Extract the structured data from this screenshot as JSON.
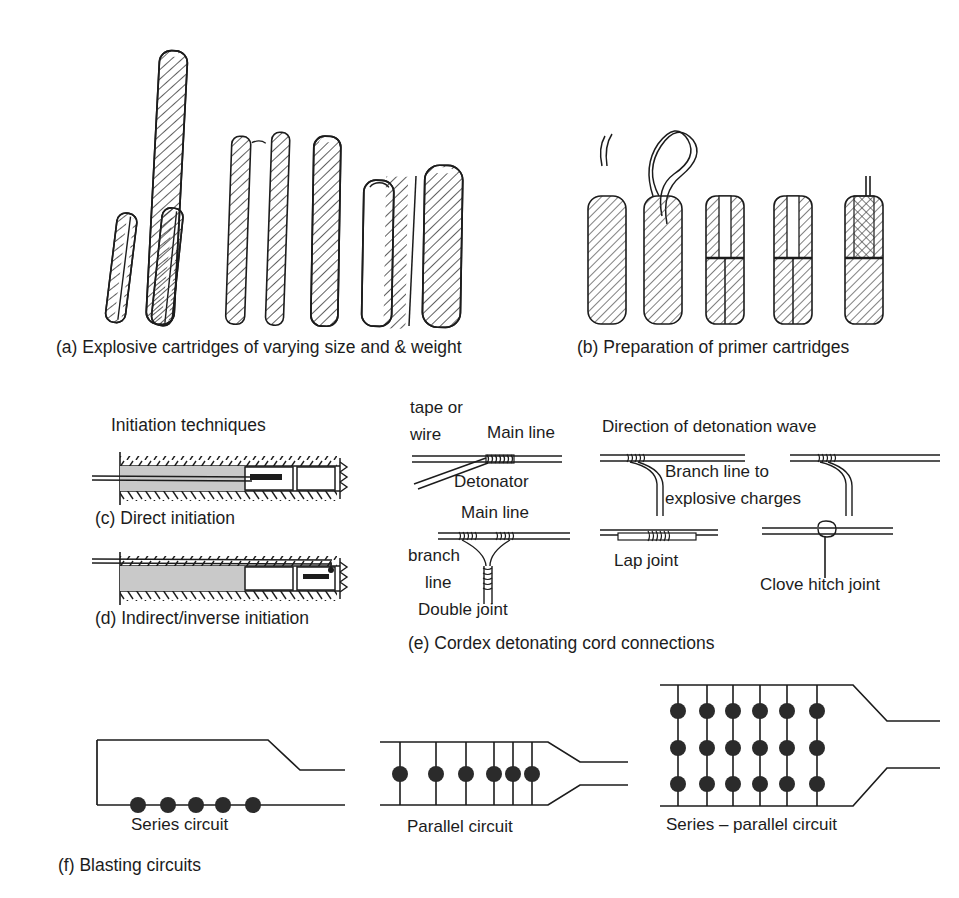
{
  "figure": {
    "ink_color": "#1c1c1c",
    "fill_gray": "#c8c8c8",
    "background": "#ffffff"
  },
  "panel_a": {
    "caption": "(a) Explosive cartridges of varying size and & weight",
    "cartridge_count": 9,
    "description": "Row of hatched cylindrical explosive cartridges leaning at varying angles and lengths"
  },
  "panel_b": {
    "caption": "(b) Preparation of primer cartridges",
    "cartridge_count": 5,
    "description": "Five primer cartridges: with detonator wires, knotted wires, punched hole, inserted detonator, capped"
  },
  "panel_c": {
    "heading": "Initiation techniques",
    "caption": "(c) Direct initiation",
    "description": "Borehole cross-section, charge column with detonator at collar end"
  },
  "panel_d": {
    "caption": "(d) Indirect/inverse initiation",
    "description": "Borehole cross-section, charge column with detonator at the bottom/toe end"
  },
  "panel_e": {
    "caption": "(e) Cordex detonating cord connections",
    "labels": {
      "tape_or_wire_l1": "tape or",
      "tape_or_wire_l2": "wire",
      "main_line_top": "Main line",
      "detonator": "Detonator",
      "main_line_mid": "Main line",
      "branch_l1": "branch",
      "branch_l2": "line",
      "double_joint": "Double joint",
      "direction_of_wave": "Direction of detonation wave",
      "branch_line_l1": "Branch line to",
      "branch_line_l2": "explosive charges",
      "lap_joint": "Lap joint",
      "clove_hitch_joint": "Clove hitch joint"
    }
  },
  "panel_f": {
    "caption": "(f) Blasting circuits",
    "circuits": [
      {
        "name": "Series circuit",
        "label": "Series circuit",
        "detonators": 5,
        "rows": 1,
        "columns": 5
      },
      {
        "name": "Parallel circuit",
        "label": "Parallel circuit",
        "detonators": 6,
        "rows": 1,
        "columns": 6
      },
      {
        "name": "Series - parallel circuit",
        "label": "Series – parallel circuit",
        "detonators": 18,
        "rows": 3,
        "columns": 6
      }
    ]
  }
}
